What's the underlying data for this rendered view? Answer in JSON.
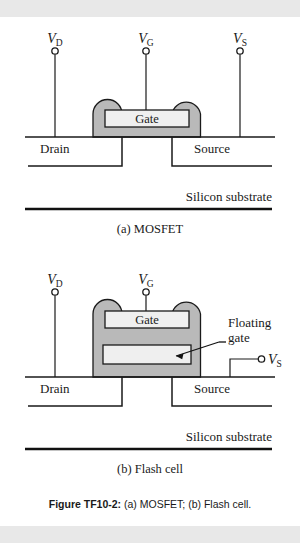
{
  "figure": {
    "caption_prefix": "Figure TF10-2:",
    "caption_rest": "(a) MOSFET; (b) Flash cell.",
    "subcaption_a": "(a) MOSFET",
    "subcaption_b": "(b) Flash cell",
    "colors": {
      "body_gray": "#b9b9b9",
      "plate_gray": "#efefef",
      "ink": "#1a1a1a",
      "page": "#ffffff",
      "band": "#e8e8e8"
    }
  },
  "mosfet": {
    "terminal_drain": "V",
    "terminal_drain_sub": "D",
    "terminal_gate": "V",
    "terminal_gate_sub": "G",
    "terminal_source": "V",
    "terminal_source_sub": "S",
    "gate_plate_label": "Gate",
    "drain_label": "Drain",
    "source_label": "Source",
    "substrate_label": "Silicon substrate"
  },
  "flash": {
    "terminal_drain": "V",
    "terminal_drain_sub": "D",
    "terminal_gate": "V",
    "terminal_gate_sub": "G",
    "terminal_source": "V",
    "terminal_source_sub": "S",
    "gate_plate_label": "Gate",
    "floating_gate_label_line1": "Floating",
    "floating_gate_label_line2": "gate",
    "drain_label": "Drain",
    "source_label": "Source",
    "substrate_label": "Silicon substrate"
  }
}
